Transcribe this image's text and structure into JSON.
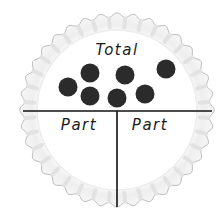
{
  "diagram": {
    "title": "Total",
    "parts": [
      {
        "label": "Part"
      },
      {
        "label": "Part"
      }
    ],
    "counters": {
      "count": 7,
      "color": "#2b2b2b",
      "positions": [
        {
          "x": 68,
          "y": 87
        },
        {
          "x": 90,
          "y": 73
        },
        {
          "x": 90,
          "y": 96
        },
        {
          "x": 117,
          "y": 98
        },
        {
          "x": 125,
          "y": 75
        },
        {
          "x": 145,
          "y": 94
        },
        {
          "x": 166,
          "y": 69
        }
      ]
    },
    "plate": {
      "rim_color": "#e6e6e6",
      "inner_color": "#ffffff",
      "edge_color": "#bdbdbd",
      "line_color": "#111111"
    }
  }
}
